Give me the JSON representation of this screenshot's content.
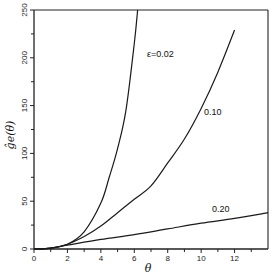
{
  "chart_data": {
    "type": "line",
    "title": "",
    "xlabel": "θ",
    "ylabel": "ĝe(θ)",
    "xlim": [
      0,
      14
    ],
    "ylim": [
      0,
      250
    ],
    "x_ticks": [
      0,
      2,
      4,
      6,
      8,
      10,
      12
    ],
    "x_minor_ticks": [
      1,
      3,
      5,
      7,
      9,
      11,
      13
    ],
    "y_ticks": [
      0,
      50,
      100,
      150,
      200,
      250
    ],
    "y_minor_ticks": [
      25,
      75,
      125,
      175,
      225
    ],
    "grid": false,
    "legend": "inline curve labels",
    "series": [
      {
        "name": "ε=0.02",
        "label": "ε=0.02",
        "x": [
          0,
          1,
          2,
          3,
          4,
          4.5,
          5,
          5.5,
          6,
          6.2
        ],
        "y": [
          0,
          1,
          5,
          18,
          48,
          75,
          105,
          145,
          215,
          250
        ]
      },
      {
        "name": "0.10",
        "label": "0.10",
        "x": [
          0,
          1,
          2,
          3,
          4,
          5,
          6,
          7,
          8,
          9,
          10,
          11,
          12
        ],
        "y": [
          0,
          1,
          5,
          13,
          24,
          38,
          52,
          66,
          90,
          115,
          147,
          185,
          229
        ]
      },
      {
        "name": "0.20",
        "label": "0.20",
        "x": [
          0,
          1,
          2,
          4,
          6,
          8,
          10,
          12,
          14
        ],
        "y": [
          0,
          1,
          4,
          10,
          15,
          21,
          27,
          32,
          38
        ]
      }
    ]
  }
}
